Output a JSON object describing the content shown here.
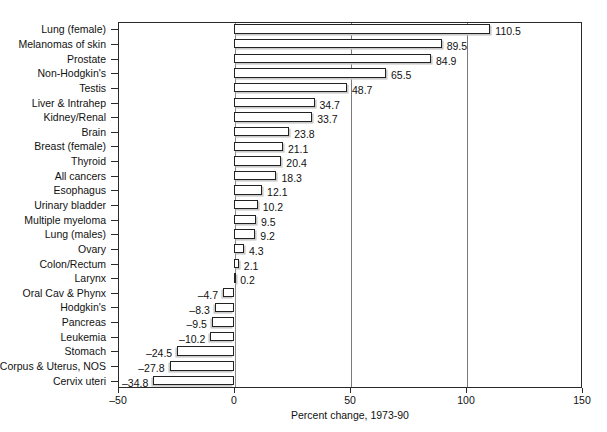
{
  "chart_data": {
    "type": "bar",
    "orientation": "horizontal",
    "title": "",
    "xlabel": "Percent change, 1973-90",
    "ylabel": "",
    "xlim": [
      -50,
      150
    ],
    "xticks": [
      -50,
      0,
      50,
      100,
      150
    ],
    "xticklabels": [
      "–50",
      "0",
      "50",
      "100",
      "150"
    ],
    "grid": "vertical gridlines at 0, 50, 100",
    "legend": null,
    "categories": [
      "Lung (female)",
      "Melanomas of skin",
      "Prostate",
      "Non-Hodgkin's",
      "Testis",
      "Liver & Intrahep",
      "Kidney/Renal",
      "Brain",
      "Breast (female)",
      "Thyroid",
      "All cancers",
      "Esophagus",
      "Urinary bladder",
      "Multiple myeloma",
      "Lung (males)",
      "Ovary",
      "Colon/Rectum",
      "Larynx",
      "Oral Cav & Phynx",
      "Hodgkin's",
      "Pancreas",
      "Leukemia",
      "Stomach",
      "Corpus & Uterus, NOS",
      "Cervix uteri"
    ],
    "values": [
      110.5,
      89.5,
      84.9,
      65.5,
      48.7,
      34.7,
      33.7,
      23.8,
      21.1,
      20.4,
      18.3,
      12.1,
      10.2,
      9.5,
      9.2,
      4.3,
      2.1,
      0.2,
      -4.7,
      -8.3,
      -9.5,
      -10.2,
      -24.5,
      -27.8,
      -34.8
    ],
    "value_labels": [
      "110.5",
      "89.5",
      "84.9",
      "65.5",
      "48.7",
      "34.7",
      "33.7",
      "23.8",
      "21.1",
      "20.4",
      "18.3",
      "12.1",
      "10.2",
      "9.5",
      "9.2",
      "4.3",
      "2.1",
      "0.2",
      "–4.7",
      "–8.3",
      "–9.5",
      "–10.2",
      "–24.5",
      "–27.8",
      "–34.8"
    ],
    "colors": {
      "bar_face": "#ffffff",
      "bar_outline": "#222222",
      "bar_shadow": "#c9c9c9",
      "axis": "#2a2a2a",
      "gridline": "#7a7a7a",
      "text": "#111111",
      "background": "#ffffff"
    }
  }
}
